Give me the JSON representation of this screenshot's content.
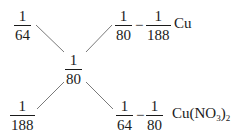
{
  "diagram": {
    "type": "cross-multiplication (十字交叉法) mixing diagram",
    "top_left": {
      "numerator": "1",
      "denominator": "64"
    },
    "top_right": {
      "term1": {
        "numerator": "1",
        "denominator": "80"
      },
      "operator": "−",
      "term2": {
        "numerator": "1",
        "denominator": "188"
      },
      "label": "Cu"
    },
    "center": {
      "numerator": "1",
      "denominator": "80"
    },
    "bottom_left": {
      "numerator": "1",
      "denominator": "188"
    },
    "bottom_right": {
      "term1": {
        "numerator": "1",
        "denominator": "64"
      },
      "operator": "−",
      "term2": {
        "numerator": "1",
        "denominator": "80"
      },
      "label_main": "Cu(NO",
      "label_sub1": "3",
      "label_close": ")",
      "label_sub2": "2"
    },
    "line_color": "#7a7a7a"
  }
}
